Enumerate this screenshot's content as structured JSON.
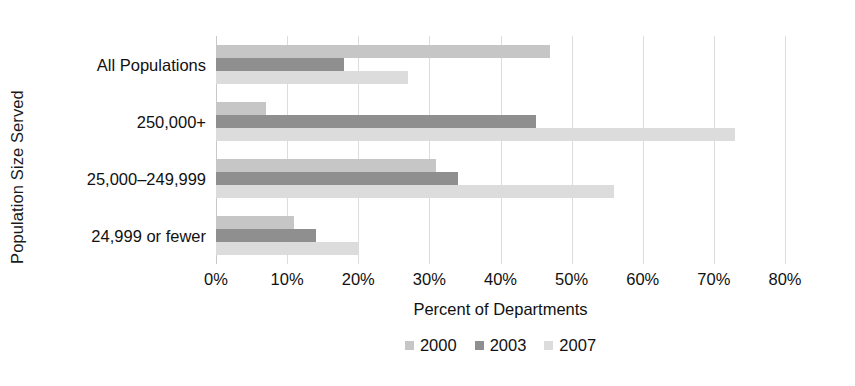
{
  "chart_data": {
    "type": "bar",
    "orientation": "horizontal",
    "title": "",
    "xlabel": "Percent of Departments",
    "ylabel": "Population Size Served",
    "xlim": [
      0,
      80
    ],
    "xticks": [
      "0%",
      "10%",
      "20%",
      "30%",
      "40%",
      "50%",
      "60%",
      "70%",
      "80%"
    ],
    "xtick_values": [
      0,
      10,
      20,
      30,
      40,
      50,
      60,
      70,
      80
    ],
    "grid": true,
    "legend_position": "bottom",
    "categories": [
      "All Populations",
      "250,000+",
      "25,000–249,999",
      "24,999 or fewer"
    ],
    "series": [
      {
        "name": "2000",
        "color": "#c6c6c6",
        "values": [
          47,
          7,
          31,
          11
        ]
      },
      {
        "name": "2003",
        "color": "#8f8f8f",
        "values": [
          18,
          45,
          34,
          14
        ]
      },
      {
        "name": "2007",
        "color": "#dcdcdc",
        "values": [
          27,
          73,
          56,
          20
        ]
      }
    ]
  },
  "legend": {
    "items": [
      {
        "label": "2000",
        "swatch": "legend-swatch-2000"
      },
      {
        "label": "2003",
        "swatch": "legend-swatch-2003"
      },
      {
        "label": "2007",
        "swatch": "legend-swatch-2007"
      }
    ]
  }
}
